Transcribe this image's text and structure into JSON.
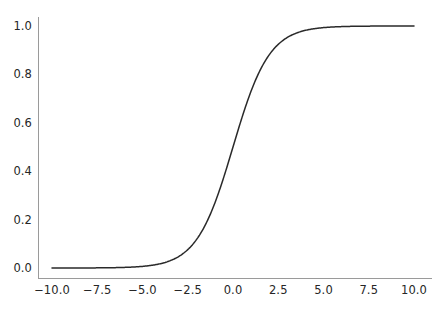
{
  "figure": {
    "width": 443,
    "height": 309,
    "background_color": "#ffffff"
  },
  "chart_data": {
    "type": "line",
    "title": "",
    "subtitle": "",
    "xlabel": "",
    "ylabel": "",
    "legend": [],
    "legend_position": "none",
    "grid": false,
    "xlim": [
      -11.0,
      11.0
    ],
    "ylim": [
      -0.05,
      1.05
    ],
    "xticks": [
      -10.0,
      -7.5,
      -5.0,
      -2.5,
      0.0,
      2.5,
      5.0,
      7.5,
      10.0
    ],
    "yticks": [
      0.0,
      0.2,
      0.4,
      0.6,
      0.8,
      1.0
    ],
    "xtick_labels": [
      "−10.0",
      "−7.5",
      "−5.0",
      "−2.5",
      "0.0",
      "2.5",
      "5.0",
      "7.5",
      "10.0"
    ],
    "ytick_labels": [
      "0.0",
      "0.2",
      "0.4",
      "0.6",
      "0.8",
      "1.0"
    ],
    "series": [
      {
        "name": "sigmoid",
        "function": "1 / (1 + exp(-x))",
        "color": "#2a2a2a",
        "linewidth": 1.5,
        "x": [
          -10.0,
          -9.5,
          -9.0,
          -8.5,
          -8.0,
          -7.5,
          -7.0,
          -6.5,
          -6.0,
          -5.5,
          -5.0,
          -4.5,
          -4.0,
          -3.5,
          -3.0,
          -2.5,
          -2.0,
          -1.5,
          -1.0,
          -0.5,
          0.0,
          0.5,
          1.0,
          1.5,
          2.0,
          2.5,
          3.0,
          3.5,
          4.0,
          4.5,
          5.0,
          5.5,
          6.0,
          6.5,
          7.0,
          7.5,
          8.0,
          8.5,
          9.0,
          9.5,
          10.0
        ],
        "y": [
          4.54e-05,
          7.49e-05,
          0.0001234,
          0.0002035,
          0.0003354,
          0.0005527,
          0.0009111,
          0.0015012,
          0.0024726,
          0.0040702,
          0.0066929,
          0.0109869,
          0.0179862,
          0.0293122,
          0.0474259,
          0.0758582,
          0.1192029,
          0.1824255,
          0.2689414,
          0.3775407,
          0.5,
          0.6224593,
          0.7310586,
          0.8175745,
          0.8807971,
          0.9241418,
          0.9525741,
          0.9706877,
          0.9820138,
          0.9890131,
          0.9933071,
          0.9959298,
          0.9975274,
          0.9984988,
          0.9990889,
          0.9994473,
          0.9996646,
          0.9997965,
          0.9998766,
          0.9999251,
          0.9999546
        ]
      }
    ]
  },
  "axes_style": {
    "spine_color": "#9a9a9a",
    "spine_width": 1.0,
    "top_spine": false,
    "right_spine": false,
    "tick_marks": false,
    "tick_label_color": "#262626"
  }
}
